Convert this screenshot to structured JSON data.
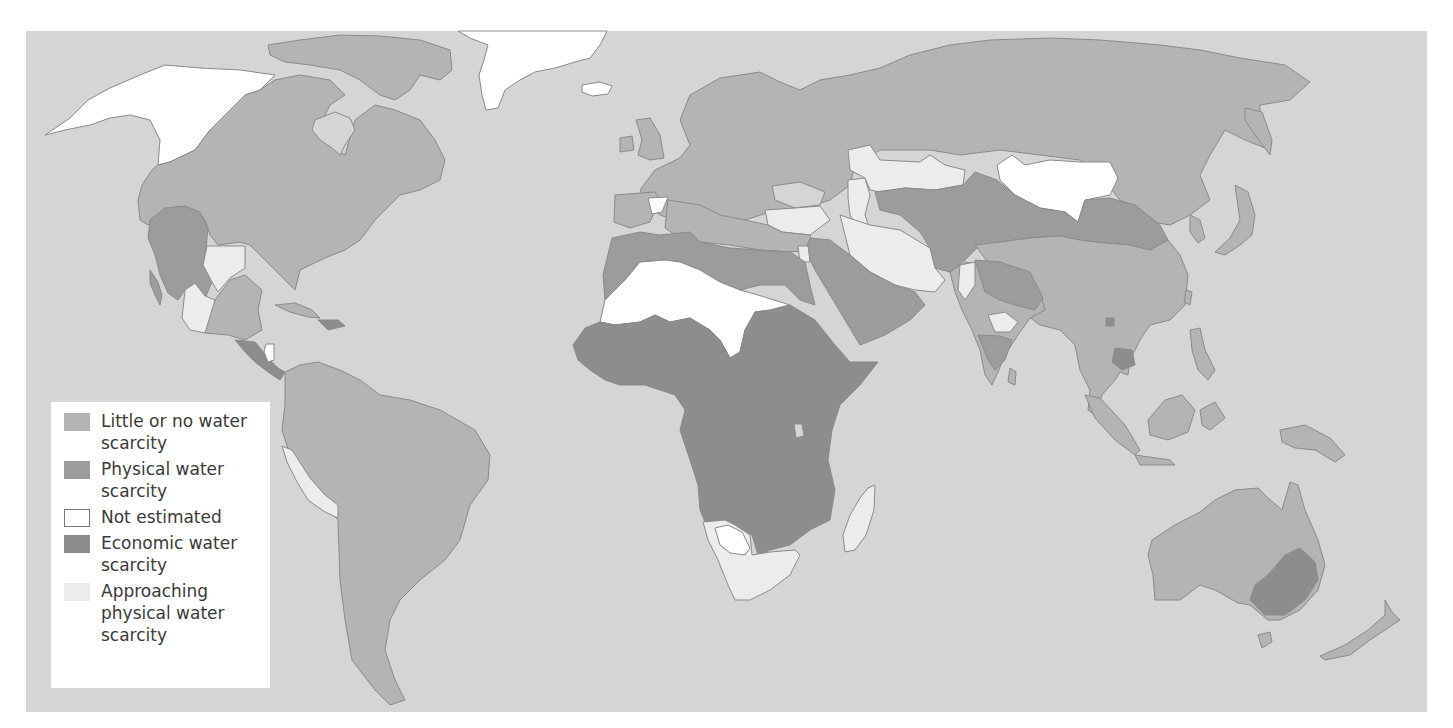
{
  "map": {
    "title": "World water scarcity",
    "colors": {
      "ocean": "#d5d5d5",
      "little_or_none": "#b4b4b4",
      "physical": "#9c9c9c",
      "not_estimated": "#ffffff",
      "economic": "#8d8d8d",
      "approaching": "#ececec",
      "border": "#8a8a8a"
    }
  },
  "legend": {
    "items": [
      {
        "key": "little_or_none",
        "label": "Little or no water scarcity",
        "color": "#b4b4b4"
      },
      {
        "key": "physical",
        "label": "Physical water scarcity",
        "color": "#9c9c9c"
      },
      {
        "key": "not_estimated",
        "label": "Not estimated",
        "color": "#ffffff"
      },
      {
        "key": "economic",
        "label": "Economic water scarcity",
        "color": "#8d8d8d"
      },
      {
        "key": "approaching",
        "label": "Approaching physical water scarcity",
        "color": "#ececec"
      }
    ]
  },
  "regions": [
    {
      "name": "Alaska / NW Canada",
      "category": "not_estimated"
    },
    {
      "name": "Canada / USA",
      "category": "little_or_none"
    },
    {
      "name": "Western USA / Mexico",
      "category": "physical"
    },
    {
      "name": "Texas",
      "category": "approaching"
    },
    {
      "name": "Central Mexico",
      "category": "approaching"
    },
    {
      "name": "Central America",
      "category": "economic"
    },
    {
      "name": "South America",
      "category": "little_or_none"
    },
    {
      "name": "Peru coast",
      "category": "approaching"
    },
    {
      "name": "Greenland",
      "category": "not_estimated"
    },
    {
      "name": "Europe / Russia",
      "category": "little_or_none"
    },
    {
      "name": "North Africa coast",
      "category": "physical"
    },
    {
      "name": "Sahara",
      "category": "not_estimated"
    },
    {
      "name": "Sub-Saharan Africa",
      "category": "economic"
    },
    {
      "name": "Southern Africa",
      "category": "approaching"
    },
    {
      "name": "Arabian Peninsula",
      "category": "physical"
    },
    {
      "name": "Iran",
      "category": "approaching"
    },
    {
      "name": "Central Asia",
      "category": "physical"
    },
    {
      "name": "Mongolia",
      "category": "not_estimated"
    },
    {
      "name": "China / SE Asia",
      "category": "little_or_none"
    },
    {
      "name": "India (parts)",
      "category": "physical"
    },
    {
      "name": "Australia",
      "category": "little_or_none"
    },
    {
      "name": "Murray-Darling basin",
      "category": "physical"
    },
    {
      "name": "Madagascar",
      "category": "approaching"
    }
  ]
}
